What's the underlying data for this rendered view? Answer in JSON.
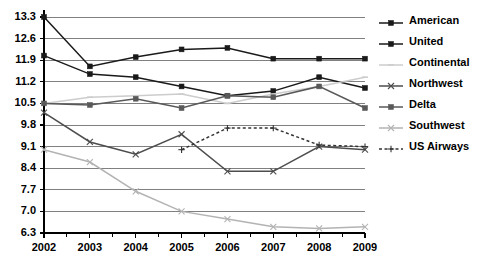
{
  "chart_data": {
    "type": "line",
    "title": "",
    "subtitle": "",
    "xlabel": "",
    "ylabel": "",
    "x": [
      "2002",
      "2003",
      "2004",
      "2005",
      "2006",
      "2007",
      "2008",
      "2009"
    ],
    "categories": [
      "2002",
      "2003",
      "2004",
      "2005",
      "2006",
      "2007",
      "2008",
      "2009"
    ],
    "ylim": [
      6.3,
      13.3
    ],
    "yticks": [
      "13.3",
      "12.6",
      "11.9",
      "11.2",
      "10.5",
      "9.8",
      "9.1",
      "8.4",
      "7.7",
      "7.0",
      "6.3"
    ],
    "ytick_values": [
      13.3,
      12.6,
      11.9,
      11.2,
      10.5,
      9.8,
      9.1,
      8.4,
      7.7,
      7.0,
      6.3
    ],
    "grid": true,
    "legend_position": "right",
    "series": [
      {
        "name": "American",
        "color": "#1a1a1a",
        "marker": "square",
        "dash": "solid",
        "values": [
          13.3,
          11.7,
          12.0,
          12.25,
          12.3,
          11.95,
          11.95,
          11.95
        ]
      },
      {
        "name": "United",
        "color": "#1a1a1a",
        "marker": "square",
        "dash": "solid",
        "values": [
          12.05,
          11.45,
          11.35,
          11.05,
          10.75,
          10.9,
          11.35,
          11.0
        ]
      },
      {
        "name": "Continental",
        "color": "#cccccc",
        "marker": "dash",
        "dash": "solid",
        "values": [
          10.5,
          10.7,
          10.75,
          10.8,
          10.5,
          10.8,
          11.05,
          11.35
        ]
      },
      {
        "name": "Northwest",
        "color": "#4d4d4d",
        "marker": "cross",
        "dash": "solid",
        "values": [
          10.2,
          9.25,
          8.85,
          9.5,
          8.3,
          8.3,
          9.1,
          9.0
        ]
      },
      {
        "name": "Delta",
        "color": "#595959",
        "marker": "square",
        "dash": "solid",
        "values": [
          10.5,
          10.45,
          10.65,
          10.35,
          10.75,
          10.7,
          11.05,
          10.35
        ]
      },
      {
        "name": "Southwest",
        "color": "#b3b3b3",
        "marker": "cross",
        "dash": "solid",
        "values": [
          9.0,
          8.6,
          7.65,
          7.0,
          6.75,
          6.5,
          6.45,
          6.5
        ]
      },
      {
        "name": "US Airways",
        "color": "#333333",
        "marker": "plus",
        "dash": "dashed",
        "values": [
          null,
          null,
          null,
          9.0,
          9.7,
          9.7,
          9.15,
          9.1
        ]
      }
    ]
  },
  "legend": {
    "items": [
      {
        "label": "American"
      },
      {
        "label": "United"
      },
      {
        "label": "Continental"
      },
      {
        "label": "Northwest"
      },
      {
        "label": "Delta"
      },
      {
        "label": "Southwest"
      },
      {
        "label": "US Airways"
      }
    ]
  },
  "colors": {
    "background": "#ffffff",
    "axis": "#000000",
    "gridline": "#808080"
  }
}
